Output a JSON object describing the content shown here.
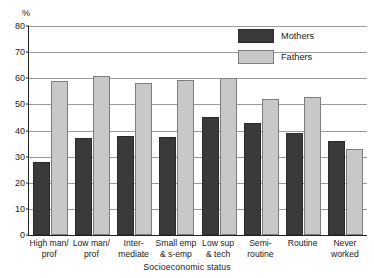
{
  "chart_data": {
    "type": "bar",
    "title": "",
    "xlabel": "Socioeconomic status",
    "ylabel": "%",
    "ylim": [
      0,
      80
    ],
    "yticks": [
      0,
      10,
      20,
      30,
      40,
      50,
      60,
      70,
      80
    ],
    "grid": true,
    "legend_position": "top-right",
    "categories": [
      "High man/\nprof",
      "Low man/\nprof",
      "Inter-\nmediate",
      "Small emp\n& s-emp",
      "Low sup\n& tech",
      "Semi-\nroutine",
      "Routine",
      "Never\nworked"
    ],
    "series": [
      {
        "name": "Mothers",
        "color": "#3a3a3a",
        "values": [
          28,
          37,
          38,
          37.5,
          45,
          43,
          39,
          36
        ]
      },
      {
        "name": "Fathers",
        "color": "#c8c8c8",
        "values": [
          59,
          61,
          58,
          59.5,
          60,
          52,
          53,
          33
        ]
      }
    ]
  },
  "axis": {
    "unit_label": "%",
    "x_title": "Socioeconomic status"
  }
}
